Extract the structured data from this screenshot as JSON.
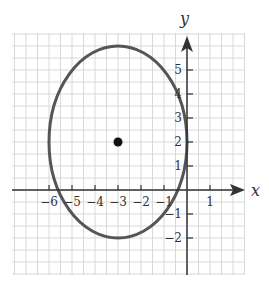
{
  "chart_data": {
    "type": "line",
    "title": "",
    "xlabel": "x",
    "ylabel": "y",
    "xlim": [
      -7.5,
      2.5
    ],
    "ylim": [
      -3.5,
      6.5
    ],
    "grid": true,
    "grid_step": 0.5,
    "x_ticks": [
      -6,
      -5,
      -4,
      -3,
      -2,
      -1,
      1
    ],
    "y_ticks": [
      -2,
      -1,
      1,
      2,
      3,
      4,
      5
    ],
    "series": [
      {
        "name": "ellipse",
        "shape": "ellipse",
        "center": [
          -3,
          2
        ],
        "semi_axis_x": 3,
        "semi_axis_y": 4,
        "color": "#555555"
      },
      {
        "name": "center-point",
        "shape": "point",
        "x": -3,
        "y": 2,
        "color": "#111111"
      }
    ]
  },
  "labels": {
    "x_axis": "x",
    "y_axis": "y",
    "x_ticks": [
      "−6",
      "−5",
      "−4",
      "−3",
      "−2",
      "−1",
      "1"
    ],
    "y_ticks": [
      "5",
      "4",
      "3",
      "2",
      "1",
      "−1",
      "−2"
    ]
  }
}
